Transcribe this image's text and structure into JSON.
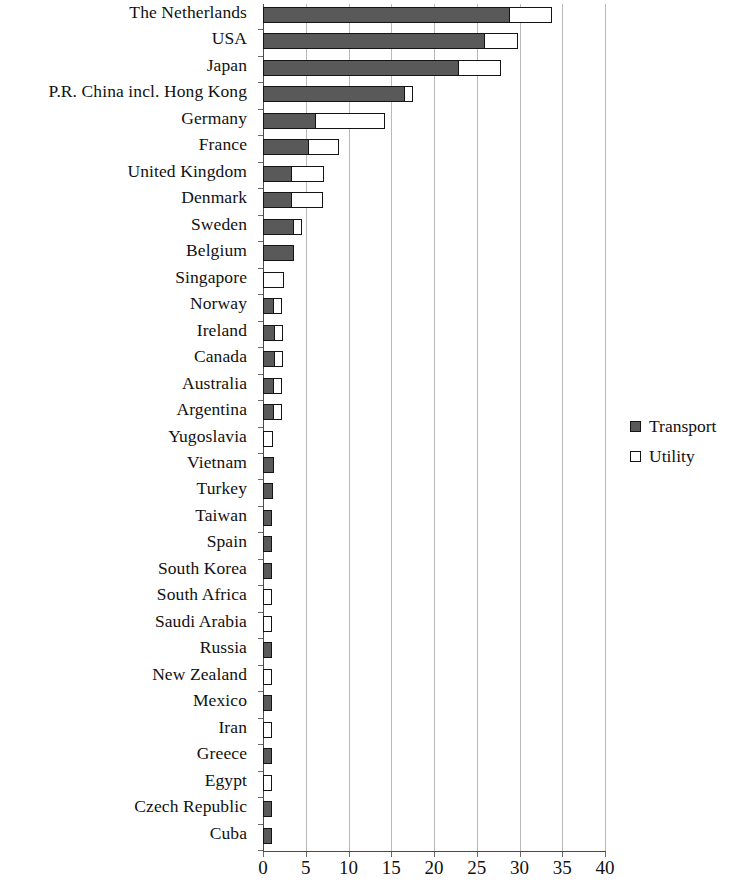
{
  "chart_data": {
    "type": "bar",
    "orientation": "horizontal",
    "stacked": true,
    "title": "",
    "subtitle": "",
    "xlabel": "",
    "ylabel": "",
    "xlim": [
      0,
      40
    ],
    "xticks": [
      0,
      5,
      10,
      15,
      20,
      25,
      30,
      35,
      40
    ],
    "xtick_labels": [
      "0",
      "5",
      "10",
      "15",
      "20",
      "25",
      "30",
      "35",
      "40"
    ],
    "grid": "vertical",
    "legend_position": "right",
    "categories": [
      "The Netherlands",
      "USA",
      "Japan",
      "P.R. China incl. Hong Kong",
      "Germany",
      "France",
      "United Kingdom",
      "Denmark",
      "Sweden",
      "Belgium",
      "Singapore",
      "Norway",
      "Ireland",
      "Canada",
      "Australia",
      "Argentina",
      "Yugoslavia",
      "Vietnam",
      "Turkey",
      "Taiwan",
      "Spain",
      "South Korea",
      "South Africa",
      "Saudi Arabia",
      "Russia",
      "New Zealand",
      "Mexico",
      "Iran",
      "Greece",
      "Egypt",
      "Czech Republic",
      "Cuba"
    ],
    "series": [
      {
        "name": "Transport",
        "color": "#595959",
        "values": [
          29.0,
          26.0,
          23.0,
          16.7,
          6.3,
          5.4,
          3.4,
          3.4,
          3.7,
          3.6,
          0.0,
          1.4,
          1.5,
          1.5,
          1.4,
          1.4,
          0.0,
          1.3,
          1.2,
          1.1,
          1.1,
          1.0,
          0.0,
          0.0,
          1.0,
          0.0,
          1.0,
          0.0,
          1.0,
          0.0,
          1.0,
          1.0
        ]
      },
      {
        "name": "Utility",
        "color": "#ffffff",
        "values": [
          5.0,
          4.0,
          5.0,
          0.6,
          8.2,
          3.7,
          3.9,
          3.8,
          0.5,
          0.0,
          2.4,
          1.0,
          0.9,
          0.9,
          1.0,
          1.0,
          1.2,
          0.0,
          0.0,
          0.0,
          0.0,
          0.0,
          1.0,
          1.0,
          0.0,
          1.0,
          0.0,
          1.0,
          0.0,
          1.0,
          0.0,
          0.0
        ]
      }
    ],
    "totals": [
      34.0,
      30.0,
      28.0,
      17.3,
      14.5,
      9.1,
      7.3,
      7.2,
      4.2,
      3.6,
      2.4,
      2.4,
      2.4,
      2.4,
      2.4,
      2.4,
      1.2,
      1.3,
      1.2,
      1.1,
      1.1,
      1.0,
      1.0,
      1.0,
      1.0,
      1.0,
      1.0,
      1.0,
      1.0,
      1.0,
      1.0,
      1.0
    ]
  },
  "legend": {
    "items": [
      {
        "label": "Transport",
        "swatch": "transport"
      },
      {
        "label": "Utility",
        "swatch": "utility"
      }
    ]
  }
}
